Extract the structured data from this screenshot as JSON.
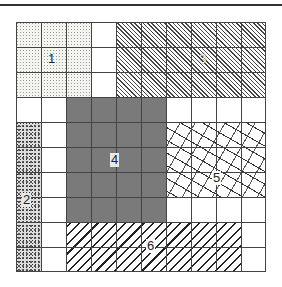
{
  "diagram": {
    "grid": {
      "rows": 10,
      "cols": 10
    },
    "regions": [
      {
        "id": "1",
        "label": "1",
        "pattern": "fine-dots",
        "cols": [
          0,
          2
        ],
        "rows": [
          0,
          2
        ]
      },
      {
        "id": "2",
        "label": "2",
        "pattern": "dense-speckle",
        "cols": [
          0,
          0
        ],
        "rows": [
          4,
          9
        ]
      },
      {
        "id": "3",
        "label": "3",
        "pattern": "fine-diagonal-hatch",
        "cols": [
          4,
          9
        ],
        "rows": [
          0,
          2
        ]
      },
      {
        "id": "4",
        "label": "4",
        "pattern": "solid-gray",
        "cols": [
          2,
          5
        ],
        "rows": [
          3,
          7
        ]
      },
      {
        "id": "5",
        "label": "5",
        "pattern": "squiggle",
        "cols": [
          6,
          9
        ],
        "rows": [
          4,
          6
        ]
      },
      {
        "id": "6",
        "label": "6",
        "pattern": "wide-diagonal-hatch",
        "cols": [
          2,
          8
        ],
        "rows": [
          8,
          9
        ]
      }
    ]
  }
}
